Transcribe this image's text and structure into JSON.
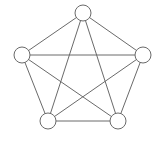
{
  "diagram": {
    "type": "complete-graph",
    "name": "K5",
    "colors": {
      "stroke": "#6a6a6a",
      "fill": "#ffffff",
      "background": "#ffffff"
    },
    "node_radius": 8,
    "nodes": [
      {
        "id": "n0",
        "position": "top",
        "x": 83,
        "y": 13
      },
      {
        "id": "n1",
        "position": "left",
        "x": 22,
        "y": 55
      },
      {
        "id": "n2",
        "position": "right",
        "x": 143,
        "y": 55
      },
      {
        "id": "n3",
        "position": "bottom-left",
        "x": 48,
        "y": 121
      },
      {
        "id": "n4",
        "position": "bottom-right",
        "x": 118,
        "y": 121
      }
    ],
    "edges": [
      [
        "n0",
        "n1"
      ],
      [
        "n0",
        "n2"
      ],
      [
        "n0",
        "n3"
      ],
      [
        "n0",
        "n4"
      ],
      [
        "n1",
        "n2"
      ],
      [
        "n1",
        "n3"
      ],
      [
        "n1",
        "n4"
      ],
      [
        "n2",
        "n3"
      ],
      [
        "n2",
        "n4"
      ],
      [
        "n3",
        "n4"
      ]
    ]
  }
}
